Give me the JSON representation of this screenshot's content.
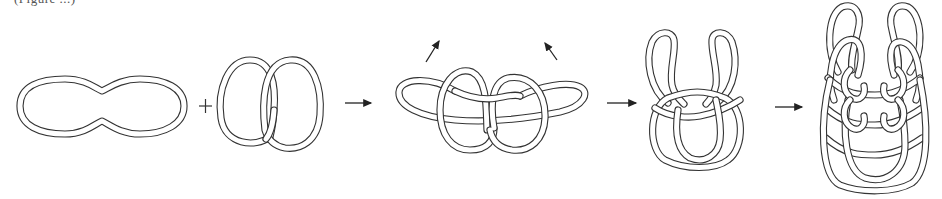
{
  "figure": {
    "caption_fragment": "(Figure ...)",
    "operators": {
      "plus": "+"
    },
    "steps": [
      {
        "id": "step-1",
        "name": "peanut-loop"
      },
      {
        "id": "step-2",
        "name": "two-interlinked-loops"
      },
      {
        "id": "step-3",
        "name": "woven-combined-figure",
        "annotations": [
          "lift-left-arrow",
          "lift-right-arrow"
        ]
      },
      {
        "id": "step-4",
        "name": "u-shaped-linked-chain"
      },
      {
        "id": "step-5",
        "name": "stacked-linked-chain"
      }
    ],
    "arrows": [
      {
        "from": "step-2",
        "to": "step-3"
      },
      {
        "from": "step-3",
        "to": "step-4"
      },
      {
        "from": "step-4",
        "to": "step-5"
      }
    ],
    "colors": {
      "line": "#333333",
      "background": "#ffffff"
    }
  }
}
